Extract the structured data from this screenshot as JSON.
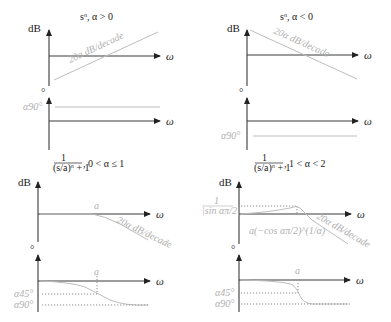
{
  "colors": {
    "axis": "#3a3a3a",
    "curve": "#bdbdbd",
    "label_gray": "#b0b0b0",
    "text": "#222222"
  },
  "panels": [
    {
      "title": "sᵅ, α > 0",
      "magnitude": {
        "y_label": "dB",
        "x_label": "ω",
        "slope_label": "20α dB/decade"
      },
      "phase": {
        "y_label": "°",
        "x_label": "ω",
        "level_label": "α90°"
      }
    },
    {
      "title": "sᵅ, α < 0",
      "magnitude": {
        "y_label": "dB",
        "x_label": "ω",
        "slope_label": "20α dB/decade"
      },
      "phase": {
        "y_label": "°",
        "x_label": "ω",
        "level_label": "α90°"
      }
    },
    {
      "title_num": "1",
      "title_den": "(s/a)ᵅ + 1",
      "title_cond": ", 0 < α ≤ 1",
      "magnitude": {
        "y_label": "dB",
        "x_label": "ω",
        "corner_label": "a",
        "slope_label": "20α dB/decade"
      },
      "phase": {
        "y_label": "°",
        "x_label": "ω",
        "corner_label": "a",
        "level1_label": "α45°",
        "level2_label": "α90°"
      }
    },
    {
      "title_num": "1",
      "title_den": "(s/a)ᵅ + 1",
      "title_cond": ", 1 < α < 2",
      "magnitude": {
        "y_label": "dB",
        "x_label": "ω",
        "peak_num": "1",
        "peak_den": "|sin απ/2|",
        "peak_freq_label": "a(−cos απ/2)^(1/α)",
        "slope_label": "20α dB/decade"
      },
      "phase": {
        "y_label": "°",
        "x_label": "ω",
        "corner_label": "a",
        "level1_label": "α45°",
        "level2_label": "α90°"
      }
    }
  ]
}
